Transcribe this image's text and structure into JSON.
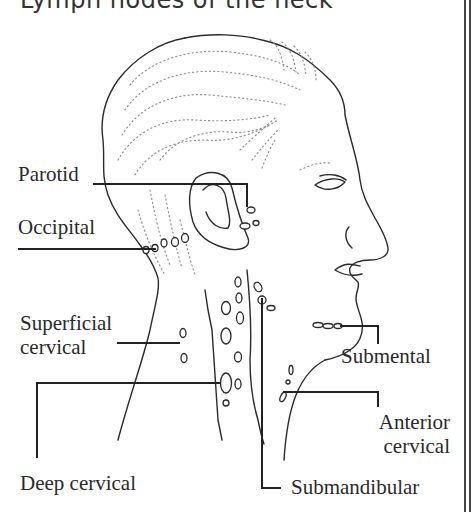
{
  "title": "Lymph nodes of the neck",
  "labels": {
    "parotid": "Parotid",
    "occipital": "Occipital",
    "superficial_cervical_1": "Superficial",
    "superficial_cervical_2": "cervical",
    "deep_cervical": "Deep cervical",
    "submental": "Submental",
    "anterior_cervical_1": "Anterior",
    "anterior_cervical_2": "cervical",
    "submandibular": "Submandibular"
  },
  "colors": {
    "ink": "#2a2a2a",
    "dots": "#888888",
    "background": "#ffffff"
  }
}
